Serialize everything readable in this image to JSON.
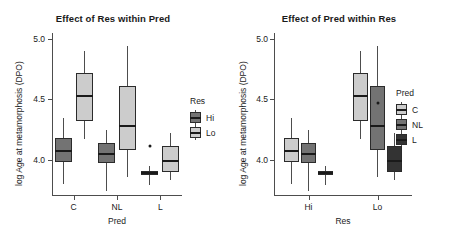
{
  "chart_data": [
    {
      "type": "box",
      "panel_id": "left",
      "title": "Effect of Res within Pred",
      "xlabel": "Pred",
      "ylabel": "log Age at metamorphosis (DPO)",
      "categories": [
        "C",
        "NL",
        "L"
      ],
      "yticks": [
        4.0,
        4.5,
        5.0
      ],
      "ytick_labels": [
        "4.0",
        "4.5",
        "5.0"
      ],
      "ylim": [
        3.7,
        5.05
      ],
      "grid": false,
      "legend": {
        "title": "Res",
        "position": "right",
        "entries": [
          {
            "label": "Hi",
            "color": "#737373"
          },
          {
            "label": "Lo",
            "color": "#cccccc"
          }
        ]
      },
      "series": [
        {
          "name": "Hi",
          "color": "#737373",
          "boxes": [
            {
              "category": "C",
              "lower_whisker": 3.8,
              "q1": 3.98,
              "median": 4.07,
              "q3": 4.18,
              "upper_whisker": 4.35,
              "outliers": []
            },
            {
              "category": "NL",
              "lower_whisker": 3.74,
              "q1": 3.97,
              "median": 4.05,
              "q3": 4.14,
              "upper_whisker": 4.25,
              "outliers": []
            },
            {
              "category": "L",
              "lower_whisker": 3.79,
              "q1": 3.87,
              "median": 3.89,
              "q3": 3.91,
              "upper_whisker": 3.95,
              "outliers": [
                4.11
              ]
            }
          ]
        },
        {
          "name": "Lo",
          "color": "#cccccc",
          "boxes": [
            {
              "category": "C",
              "lower_whisker": 4.17,
              "q1": 4.32,
              "median": 4.53,
              "q3": 4.72,
              "upper_whisker": 4.9,
              "outliers": []
            },
            {
              "category": "NL",
              "lower_whisker": 3.86,
              "q1": 4.08,
              "median": 4.28,
              "q3": 4.61,
              "upper_whisker": 4.94,
              "outliers": []
            },
            {
              "category": "L",
              "lower_whisker": 3.83,
              "q1": 3.9,
              "median": 3.99,
              "q3": 4.11,
              "upper_whisker": 4.22,
              "outliers": []
            }
          ]
        }
      ]
    },
    {
      "type": "box",
      "panel_id": "right",
      "title": "Effect of Pred within Res",
      "xlabel": "Res",
      "ylabel": "log Age at metamorphosis (DPO)",
      "categories": [
        "Hi",
        "Lo"
      ],
      "yticks": [
        4.0,
        4.5,
        5.0
      ],
      "ytick_labels": [
        "4.0",
        "4.5",
        "5.0"
      ],
      "ylim": [
        3.7,
        5.05
      ],
      "grid": false,
      "legend": {
        "title": "Pred",
        "position": "right",
        "entries": [
          {
            "label": "C",
            "color": "#cccccc"
          },
          {
            "label": "NL",
            "color": "#737373"
          },
          {
            "label": "L",
            "color": "#333333"
          }
        ]
      },
      "series": [
        {
          "name": "C",
          "color": "#cccccc",
          "boxes": [
            {
              "category": "Hi",
              "lower_whisker": 3.8,
              "q1": 3.98,
              "median": 4.07,
              "q3": 4.18,
              "upper_whisker": 4.35,
              "outliers": []
            },
            {
              "category": "Lo",
              "lower_whisker": 4.17,
              "q1": 4.32,
              "median": 4.53,
              "q3": 4.72,
              "upper_whisker": 4.9,
              "outliers": []
            }
          ]
        },
        {
          "name": "NL",
          "color": "#737373",
          "boxes": [
            {
              "category": "Hi",
              "lower_whisker": 3.74,
              "q1": 3.97,
              "median": 4.05,
              "q3": 4.14,
              "upper_whisker": 4.25,
              "outliers": []
            },
            {
              "category": "Lo",
              "lower_whisker": 3.86,
              "q1": 4.08,
              "median": 4.28,
              "q3": 4.61,
              "upper_whisker": 4.94,
              "outliers": [
                4.47
              ]
            }
          ]
        },
        {
          "name": "L",
          "color": "#333333",
          "boxes": [
            {
              "category": "Hi",
              "lower_whisker": 3.79,
              "q1": 3.87,
              "median": 3.89,
              "q3": 3.91,
              "upper_whisker": 3.95,
              "outliers": []
            },
            {
              "category": "Lo",
              "lower_whisker": 3.83,
              "q1": 3.9,
              "median": 3.99,
              "q3": 4.11,
              "upper_whisker": 4.22,
              "outliers": []
            }
          ]
        }
      ]
    }
  ]
}
